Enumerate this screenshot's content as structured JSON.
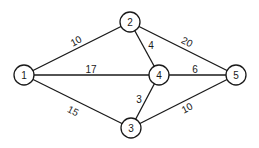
{
  "graph": {
    "nodes": [
      {
        "id": "1",
        "label": "1",
        "x": 24,
        "y": 75
      },
      {
        "id": "2",
        "label": "2",
        "x": 130,
        "y": 22
      },
      {
        "id": "3",
        "label": "3",
        "x": 131,
        "y": 128
      },
      {
        "id": "4",
        "label": "4",
        "x": 159,
        "y": 75
      },
      {
        "id": "5",
        "label": "5",
        "x": 236,
        "y": 75
      }
    ],
    "edges": [
      {
        "from": "1",
        "to": "2",
        "weight": "10"
      },
      {
        "from": "1",
        "to": "4",
        "weight": "17"
      },
      {
        "from": "1",
        "to": "3",
        "weight": "15"
      },
      {
        "from": "2",
        "to": "4",
        "weight": "4"
      },
      {
        "from": "2",
        "to": "5",
        "weight": "20"
      },
      {
        "from": "4",
        "to": "5",
        "weight": "6"
      },
      {
        "from": "3",
        "to": "4",
        "weight": "3"
      },
      {
        "from": "3",
        "to": "5",
        "weight": "10"
      }
    ]
  }
}
